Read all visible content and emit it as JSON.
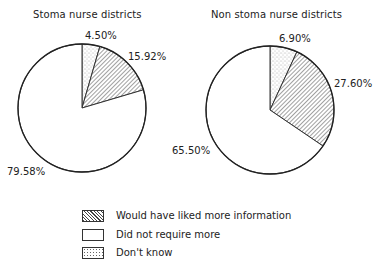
{
  "chart_data": [
    {
      "type": "pie",
      "title": "Stoma nurse districts",
      "categories": [
        "Would have liked more information",
        "Did not require more",
        "Don't know"
      ],
      "values": [
        15.92,
        79.58,
        4.5
      ],
      "labels": [
        "15.92%",
        "79.58%",
        "4.50%"
      ]
    },
    {
      "type": "pie",
      "title": "Non stoma nurse districts",
      "categories": [
        "Would have liked more information",
        "Did not require more",
        "Don't know"
      ],
      "values": [
        27.6,
        65.5,
        6.9
      ],
      "labels": [
        "27.60%",
        "65.50%",
        "6.90%"
      ]
    }
  ],
  "legend": {
    "position": "bottom-center",
    "items": [
      {
        "label": "Would have liked more information",
        "pattern": "diagonal-hatch"
      },
      {
        "label": "Did not require more",
        "pattern": "blank"
      },
      {
        "label": "Don't know",
        "pattern": "stipple"
      }
    ]
  }
}
